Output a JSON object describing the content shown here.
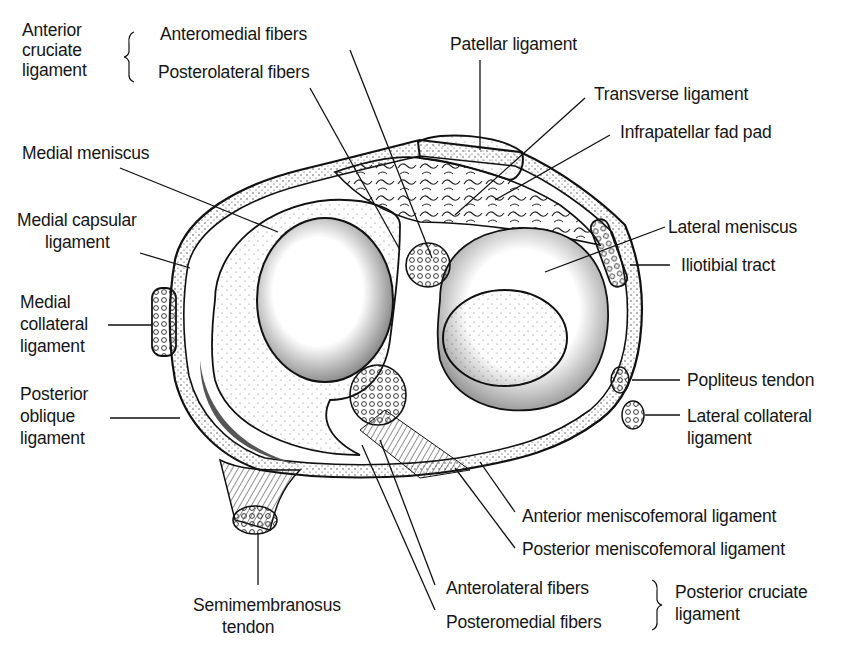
{
  "diagram": {
    "groups": {
      "anterior_cruciate": {
        "title_lines": [
          "Anterior",
          "cruciate",
          "ligament"
        ],
        "items": [
          "Anteromedial fibers",
          "Posterolateral fibers"
        ]
      },
      "posterior_cruciate": {
        "title_lines": [
          "Posterior cruciate",
          "ligament"
        ],
        "items": [
          "Anterolateral fibers",
          "Posteromedial fibers"
        ]
      }
    },
    "labels": {
      "patellar_ligament": "Patellar ligament",
      "transverse_ligament": "Transverse ligament",
      "infrapatellar_fat_pad": "Infrapatellar fad pad",
      "medial_meniscus": "Medial meniscus",
      "medial_capsular_ligament": [
        "Medial capsular",
        "ligament"
      ],
      "medial_collateral_ligament": [
        "Medial",
        "collateral",
        "ligament"
      ],
      "posterior_oblique_ligament": [
        "Posterior",
        "oblique",
        "ligament"
      ],
      "lateral_meniscus": "Lateral meniscus",
      "iliotibial_tract": "Iliotibial tract",
      "popliteus_tendon": "Popliteus tendon",
      "lateral_collateral_ligament": [
        "Lateral collateral",
        "ligament"
      ],
      "anterior_meniscofemoral_ligament": "Anterior meniscofemoral ligament",
      "posterior_meniscofemoral_ligament": "Posterior meniscofemoral ligament",
      "semimembranosus_tendon": [
        "Semimembranosus",
        "tendon"
      ]
    },
    "colors": {
      "ink": "#161616",
      "background": "#ffffff",
      "stipple": "#555555"
    }
  }
}
